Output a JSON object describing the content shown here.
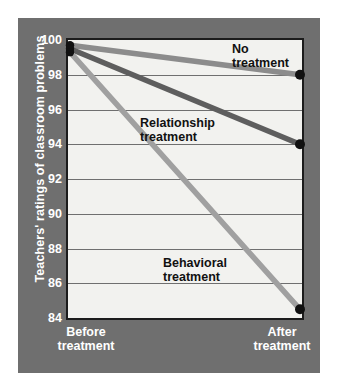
{
  "chart_data": {
    "type": "line",
    "title": "",
    "xlabel": "",
    "ylabel": "Teachers' ratings of classroom problems",
    "categories": [
      "Before treatment",
      "After treatment"
    ],
    "x_tick_labels": [
      "Before\ntreatment",
      "After\ntreatment"
    ],
    "ylim": [
      84,
      100
    ],
    "y_ticks": [
      84,
      86,
      88,
      90,
      92,
      94,
      96,
      98,
      100
    ],
    "y_tick_labels": [
      "84",
      "86",
      "88",
      "90",
      "92",
      "94",
      "96",
      "98",
      "100"
    ],
    "grid": "horizontal",
    "legend": "inline-annotations",
    "series": [
      {
        "name": "No treatment",
        "label": "No\ntreatment",
        "values": [
          99.7,
          98.0
        ],
        "color": "#8c8c8c",
        "marker": "circle",
        "marker_color": "#111111"
      },
      {
        "name": "Relationship treatment",
        "label": "Relationship\ntreatment",
        "values": [
          99.5,
          94.0
        ],
        "color": "#5e5e5e",
        "marker": "circle",
        "marker_color": "#111111"
      },
      {
        "name": "Behavioral treatment",
        "label": "Behavioral\ntreatment",
        "values": [
          99.3,
          84.5
        ],
        "color": "#a0a0a0",
        "marker": "circle",
        "marker_color": "#111111"
      }
    ],
    "colors": {
      "panel": "#6f6f6f",
      "plot_background": "#f2f2ef",
      "axis": "#1c1c1c",
      "gridline": "#6f6f6f",
      "tick_text": "#ffffff",
      "annotation_text": "#111111"
    }
  },
  "axis": {
    "y_title": "Teachers' ratings of classroom problems"
  },
  "x_labels": {
    "before": "Before\ntreatment",
    "after": "After\ntreatment"
  },
  "annotations": {
    "no_treatment": "No\ntreatment",
    "relationship": "Relationship\ntreatment",
    "behavioral": "Behavioral\ntreatment"
  }
}
